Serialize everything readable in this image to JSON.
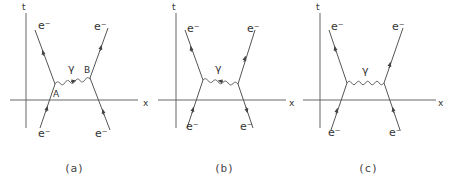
{
  "diagrams": [
    {
      "caption": "(a)",
      "axis_t_label": "t",
      "axis_x_label": "x",
      "photon_label": "γ",
      "vertex_a_label": "A",
      "vertex_b_label": "B",
      "electron_label": "e⁻",
      "photon_arrow": "right"
    },
    {
      "caption": "(b)",
      "axis_t_label": "t",
      "axis_x_label": "x",
      "photon_label": "γ",
      "electron_label": "e⁻",
      "photon_arrow": "left"
    },
    {
      "caption": "(c)",
      "axis_t_label": "t",
      "axis_x_label": "x",
      "photon_label": "γ",
      "electron_label": "e⁻",
      "photon_arrow": "none"
    }
  ]
}
